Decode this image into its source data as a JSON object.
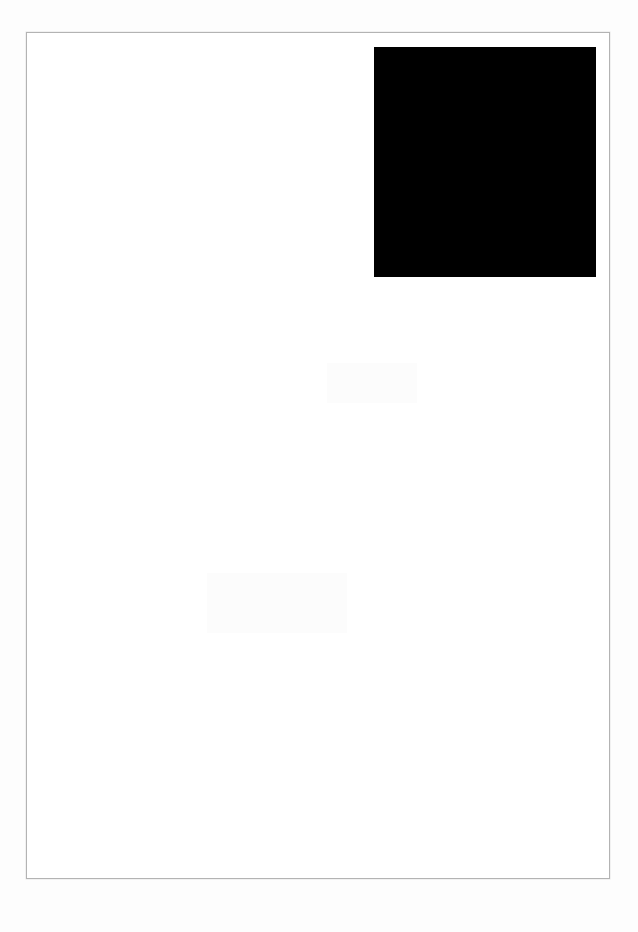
{
  "document": {
    "kind": "artwork-scan",
    "background_color": "#fdfdfd",
    "page": {
      "fill_color": "#ffffff",
      "border_color": "#b3b3b3",
      "border_width_px": 1,
      "x": 26,
      "y": 32,
      "width": 584,
      "height": 847
    },
    "figures": [
      {
        "name": "black-square",
        "shape": "rectangle",
        "fill_color": "#000000",
        "x": 374,
        "y": 47,
        "width": 222,
        "height": 230
      }
    ],
    "text_content": "",
    "caption_left": "",
    "caption_right": ""
  }
}
